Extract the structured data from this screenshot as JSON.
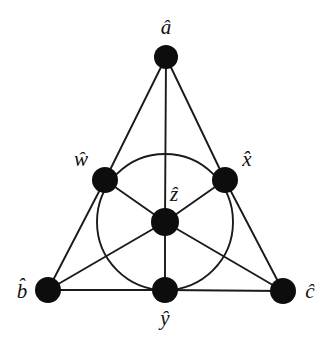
{
  "figure": {
    "type": "incidence-geometry-diagram",
    "name": "Fano plane",
    "background_color": "#ffffff",
    "stroke_color": "#1a1a1a",
    "node_fill_color": "#0d0d0d",
    "width": 333,
    "height": 349
  },
  "nodes": [
    {
      "id": "a",
      "label": "â",
      "cx": 166,
      "cy": 57,
      "r": 12,
      "label_x": 166,
      "label_y": 27,
      "label_pos": "above"
    },
    {
      "id": "w",
      "label": "ŵ",
      "cx": 105,
      "cy": 180,
      "r": 13,
      "label_x": 81,
      "label_y": 159,
      "label_pos": "upper-left"
    },
    {
      "id": "x",
      "label": "x̂",
      "cx": 225,
      "cy": 180,
      "r": 13,
      "label_x": 247,
      "label_y": 159,
      "label_pos": "upper-right"
    },
    {
      "id": "z",
      "label": "ẑ",
      "cx": 165,
      "cy": 222,
      "r": 14,
      "label_x": 174,
      "label_y": 194,
      "label_pos": "above"
    },
    {
      "id": "b",
      "label": "b̂",
      "cx": 48,
      "cy": 290,
      "r": 13,
      "label_x": 22,
      "label_y": 291,
      "label_pos": "left"
    },
    {
      "id": "y",
      "label": "ŷ",
      "cx": 165,
      "cy": 290,
      "r": 13,
      "label_x": 165,
      "label_y": 318,
      "label_pos": "below"
    },
    {
      "id": "c",
      "label": "ĉ",
      "cx": 283,
      "cy": 291,
      "r": 13,
      "label_x": 310,
      "label_y": 291,
      "label_pos": "right"
    }
  ],
  "lines": [
    {
      "id": "line-a-w-b",
      "kind": "straight",
      "points": [
        "a",
        "w",
        "b"
      ]
    },
    {
      "id": "line-a-x-c",
      "kind": "straight",
      "points": [
        "a",
        "x",
        "c"
      ]
    },
    {
      "id": "line-b-y-c",
      "kind": "straight",
      "points": [
        "b",
        "y",
        "c"
      ]
    },
    {
      "id": "line-a-z-y",
      "kind": "straight",
      "points": [
        "a",
        "z",
        "y"
      ]
    },
    {
      "id": "line-b-z-x",
      "kind": "straight",
      "points": [
        "b",
        "z",
        "x"
      ]
    },
    {
      "id": "line-c-z-w",
      "kind": "straight",
      "points": [
        "c",
        "z",
        "w"
      ]
    },
    {
      "id": "line-w-x-y",
      "kind": "circle",
      "points": [
        "w",
        "x",
        "y"
      ],
      "cx": 165,
      "cy": 222,
      "r": 68
    }
  ]
}
